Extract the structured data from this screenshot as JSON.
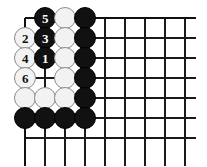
{
  "diagram": {
    "type": "go-board-problem",
    "board": {
      "columns": 9,
      "rows": 7,
      "origin_x": 25,
      "origin_y": 18,
      "spacing": 20,
      "line_color": "#1a1a1a",
      "edge_color": "#111111",
      "background_color": "#ffffff",
      "left_edge_is_board_border": true,
      "top_edge_is_board_border": true,
      "bottom_overhang": 28,
      "right_end_x": 196
    },
    "stone_colors": {
      "black_fill": "#111111",
      "white_fill": "#f2f2f2",
      "white_border": "#8c8c8c",
      "black_number_color": "#ffffff",
      "white_number_color": "#111111"
    },
    "stone_radius": 11,
    "stones": [
      {
        "col": 2,
        "row": 1,
        "color": "black",
        "label": "5"
      },
      {
        "col": 3,
        "row": 1,
        "color": "white",
        "label": ""
      },
      {
        "col": 4,
        "row": 1,
        "color": "black",
        "label": ""
      },
      {
        "col": 1,
        "row": 2,
        "color": "white",
        "label": "2"
      },
      {
        "col": 2,
        "row": 2,
        "color": "black",
        "label": "3"
      },
      {
        "col": 3,
        "row": 2,
        "color": "white",
        "label": ""
      },
      {
        "col": 4,
        "row": 2,
        "color": "black",
        "label": ""
      },
      {
        "col": 1,
        "row": 3,
        "color": "white",
        "label": "4"
      },
      {
        "col": 2,
        "row": 3,
        "color": "black",
        "label": "1"
      },
      {
        "col": 3,
        "row": 3,
        "color": "white",
        "label": ""
      },
      {
        "col": 4,
        "row": 3,
        "color": "black",
        "label": ""
      },
      {
        "col": 1,
        "row": 4,
        "color": "white",
        "label": "6"
      },
      {
        "col": 3,
        "row": 4,
        "color": "white",
        "label": ""
      },
      {
        "col": 4,
        "row": 4,
        "color": "black",
        "label": ""
      },
      {
        "col": 1,
        "row": 5,
        "color": "white",
        "label": ""
      },
      {
        "col": 2,
        "row": 5,
        "color": "white",
        "label": ""
      },
      {
        "col": 3,
        "row": 5,
        "color": "white",
        "label": ""
      },
      {
        "col": 4,
        "row": 5,
        "color": "black",
        "label": ""
      },
      {
        "col": 1,
        "row": 6,
        "color": "black",
        "label": ""
      },
      {
        "col": 2,
        "row": 6,
        "color": "black",
        "label": ""
      },
      {
        "col": 3,
        "row": 6,
        "color": "black",
        "label": ""
      },
      {
        "col": 4,
        "row": 6,
        "color": "black",
        "label": ""
      }
    ],
    "move_sequence": [
      {
        "number": "1",
        "color": "black",
        "col": 2,
        "row": 3
      },
      {
        "number": "2",
        "color": "white",
        "col": 1,
        "row": 2
      },
      {
        "number": "3",
        "color": "black",
        "col": 2,
        "row": 2
      },
      {
        "number": "4",
        "color": "white",
        "col": 1,
        "row": 3
      },
      {
        "number": "5",
        "color": "black",
        "col": 2,
        "row": 1
      },
      {
        "number": "6",
        "color": "white",
        "col": 1,
        "row": 4
      }
    ],
    "empty_intersections": [
      {
        "col": 1,
        "row": 1
      },
      {
        "col": 2,
        "row": 4
      }
    ]
  }
}
